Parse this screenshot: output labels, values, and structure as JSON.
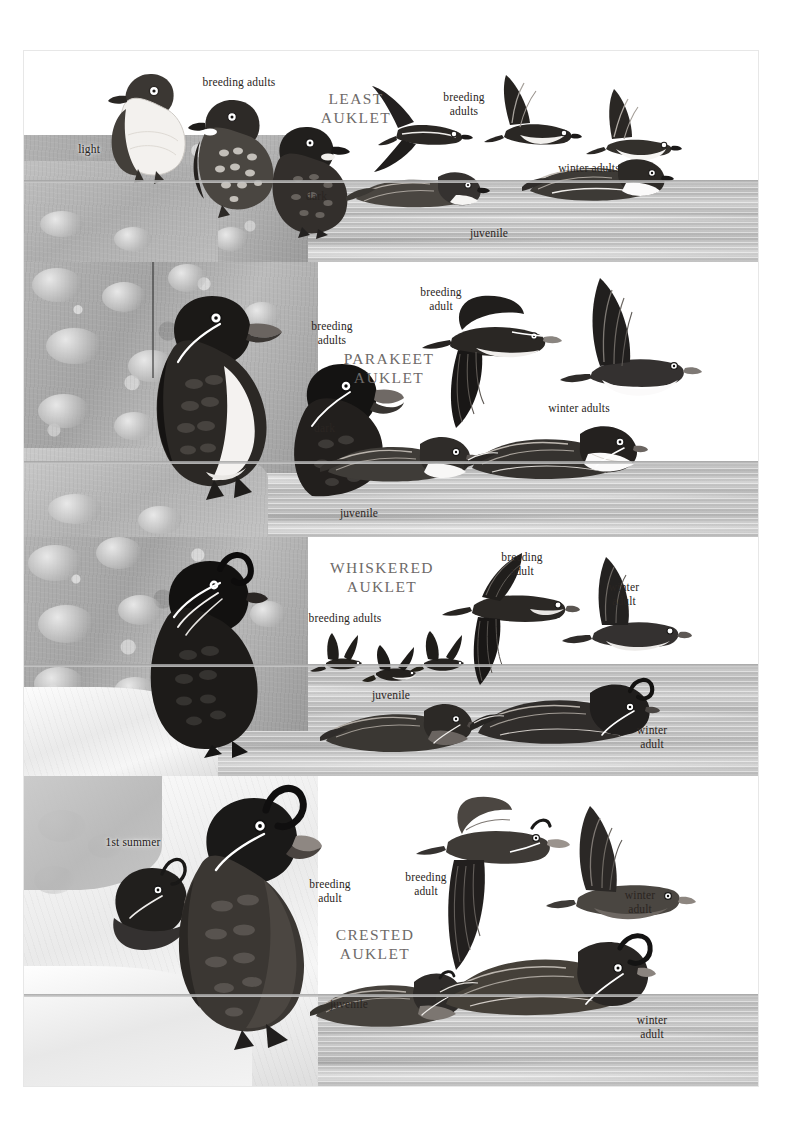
{
  "page": {
    "kind": "field-guide-plate",
    "background": "#ffffff",
    "plate_border": "#e7e7e7",
    "species_label_color": "#6e6a68",
    "annotation_color": "#2a2522",
    "water_color": "#c2c2c2",
    "rock_color": "#a9a9a9",
    "snow_color": "#f0f0f0"
  },
  "panels": [
    {
      "id": "least-auklet",
      "species_title": "LEAST\nAUKLET",
      "labels": [
        {
          "id": "p1-light",
          "text": "light"
        },
        {
          "id": "p1-breeding-adults",
          "text": "breeding adults"
        },
        {
          "id": "p1-dark",
          "text": "dark"
        },
        {
          "id": "p1-breeding-adults-2",
          "text": "breeding\nadults"
        },
        {
          "id": "p1-winter-adults",
          "text": "winter adults"
        },
        {
          "id": "p1-juvenile",
          "text": "juvenile"
        }
      ]
    },
    {
      "id": "parakeet-auklet",
      "species_title": "PARAKEET\nAUKLET",
      "labels": [
        {
          "id": "p2-breeding-adults",
          "text": "breeding\nadults"
        },
        {
          "id": "p2-dark",
          "text": "dark"
        },
        {
          "id": "p2-juvenile",
          "text": "juvenile"
        },
        {
          "id": "p2-breeding-adult",
          "text": "breeding\nadult"
        },
        {
          "id": "p2-winter-adults",
          "text": "winter adults"
        }
      ]
    },
    {
      "id": "whiskered-auklet",
      "species_title": "WHISKERED\nAUKLET",
      "labels": [
        {
          "id": "p3-breeding-adults",
          "text": "breeding adults"
        },
        {
          "id": "p3-breeding-adult",
          "text": "breeding\nadult"
        },
        {
          "id": "p3-winter-adult-fly",
          "text": "winter\nadult"
        },
        {
          "id": "p3-juvenile",
          "text": "juvenile"
        },
        {
          "id": "p3-winter-adult-sw",
          "text": "winter\nadult"
        }
      ]
    },
    {
      "id": "crested-auklet",
      "species_title": "CRESTED\nAUKLET",
      "labels": [
        {
          "id": "p4-1st-summer",
          "text": "1st summer"
        },
        {
          "id": "p4-breeding-adult",
          "text": "breeding\nadult"
        },
        {
          "id": "p4-breeding-adult-2",
          "text": "breeding\nadult"
        },
        {
          "id": "p4-winter-adult-fly",
          "text": "winter\nadult"
        },
        {
          "id": "p4-juvenile",
          "text": "juvenile"
        },
        {
          "id": "p4-winter-adult-sw",
          "text": "winter\nadult"
        }
      ]
    }
  ]
}
